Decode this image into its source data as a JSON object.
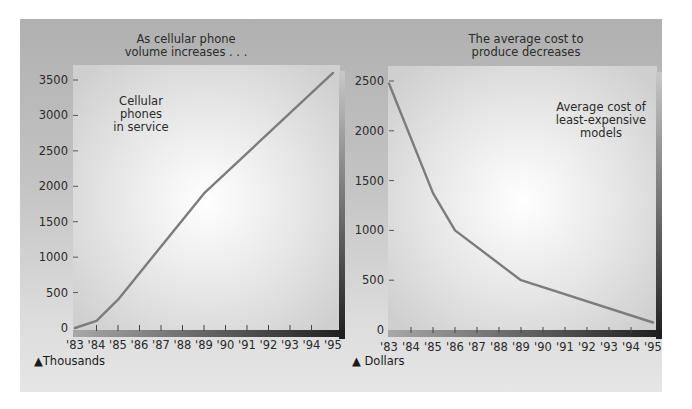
{
  "colors": {
    "line": "#7c7c7c",
    "axis_dark": "#2e2e2e",
    "text": "#2a2a2a"
  },
  "chart_data": [
    {
      "type": "line",
      "title": "As cellular phone volume increases . . .",
      "title_lines": [
        "As cellular phone",
        "volume increases . . ."
      ],
      "annotation_lines": [
        "Cellular",
        "phones",
        "in service"
      ],
      "xlabel": "",
      "ylabel": "",
      "unit_label": "Thousands",
      "categories": [
        "'83",
        "'84",
        "'85",
        "'86",
        "'87",
        "'88",
        "'89",
        "'90",
        "'91",
        "'92",
        "'93",
        "'94",
        "'95"
      ],
      "yticks": [
        0,
        500,
        1000,
        1500,
        2000,
        2500,
        3000,
        3500
      ],
      "ylim": [
        0,
        3600
      ],
      "grid": false,
      "series": [
        {
          "name": "Cellular phones in service",
          "points": [
            {
              "x": "'83",
              "y": 0
            },
            {
              "x": "'84",
              "y": 100
            },
            {
              "x": "'85",
              "y": 400
            },
            {
              "x": "'89",
              "y": 1900
            },
            {
              "x": "'95",
              "y": 3600
            }
          ]
        }
      ]
    },
    {
      "type": "line",
      "title": "The average cost to produce decreases",
      "title_lines": [
        "The average cost to",
        "produce decreases"
      ],
      "annotation_lines": [
        "Average cost of",
        "least-expensive",
        "models"
      ],
      "xlabel": "",
      "ylabel": "",
      "unit_label": "Dollars",
      "categories": [
        "'83",
        "'84",
        "'85",
        "'86",
        "'87",
        "'88",
        "'89",
        "'90",
        "'91",
        "'92",
        "'93",
        "'94",
        "'95"
      ],
      "yticks": [
        0,
        500,
        1000,
        1500,
        2000,
        2500
      ],
      "ylim": [
        0,
        2500
      ],
      "grid": false,
      "series": [
        {
          "name": "Average cost of least-expensive models",
          "points": [
            {
              "x": "'83",
              "y": 2475
            },
            {
              "x": "'85",
              "y": 1375
            },
            {
              "x": "'86",
              "y": 1000
            },
            {
              "x": "'89",
              "y": 500
            },
            {
              "x": "'95",
              "y": 75
            }
          ]
        }
      ]
    }
  ]
}
